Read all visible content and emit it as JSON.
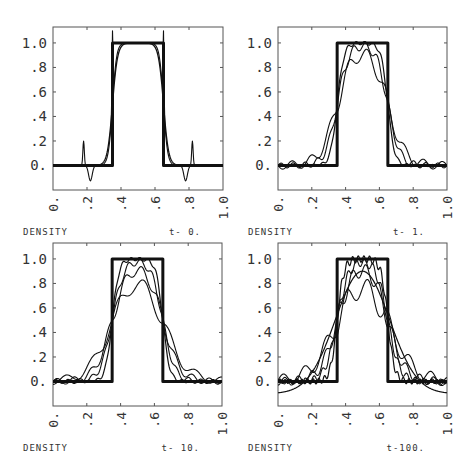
{
  "chart_data": [
    {
      "type": "line",
      "panel": "top-left",
      "time_label": "t- 0.",
      "xlabel": "DENSITY",
      "xlim": [
        0,
        1
      ],
      "ylim": [
        -0.2,
        1.13
      ],
      "x_ticks": [
        "0.",
        ".2",
        ".4",
        ".6",
        ".8",
        "1.0"
      ],
      "y_ticks": [
        "0.",
        ".2",
        ".4",
        ".6",
        ".8",
        "1.0"
      ],
      "series": [
        {
          "name": "exact",
          "kind": "pulse",
          "lo": 0.35,
          "hi": 0.65,
          "width": 3
        },
        {
          "name": "solution-a",
          "kind": "smooth",
          "lo": 0.35,
          "hi": 0.65,
          "edge": 0.015,
          "ripple": 0.0,
          "width": 1.3
        },
        {
          "name": "solution-b",
          "kind": "overshoot",
          "lo": 0.35,
          "hi": 0.65,
          "edge": 0.012,
          "spike": 0.25,
          "width": 1.1
        }
      ]
    },
    {
      "type": "line",
      "panel": "top-right",
      "time_label": "t- 1.",
      "xlabel": "DENSITY",
      "xlim": [
        0,
        1
      ],
      "ylim": [
        -0.2,
        1.13
      ],
      "x_ticks": [
        "0.",
        ".2",
        ".4",
        ".6",
        ".8",
        "1.0"
      ],
      "y_ticks": [
        "0.",
        ".2",
        ".4",
        ".6",
        ".8",
        "1.0"
      ],
      "series": [
        {
          "name": "exact",
          "kind": "pulse",
          "lo": 0.35,
          "hi": 0.65,
          "width": 3
        },
        {
          "name": "solution-a",
          "kind": "smooth",
          "lo": 0.35,
          "hi": 0.65,
          "edge": 0.02,
          "ripple": 0.02,
          "freq": 40,
          "width": 1.2
        },
        {
          "name": "solution-b",
          "kind": "smooth",
          "lo": 0.35,
          "hi": 0.65,
          "edge": 0.035,
          "ripple": 0.05,
          "freq": 28,
          "width": 1.1
        },
        {
          "name": "solution-c",
          "kind": "smooth",
          "lo": 0.35,
          "hi": 0.65,
          "edge": 0.05,
          "ripple": 0.08,
          "freq": 18,
          "width": 1.1
        }
      ]
    },
    {
      "type": "line",
      "panel": "bottom-left",
      "time_label": "t- 10.",
      "xlabel": "DENSITY",
      "xlim": [
        0,
        1
      ],
      "ylim": [
        -0.2,
        1.13
      ],
      "x_ticks": [
        "0.",
        ".2",
        ".4",
        ".6",
        ".8",
        "1.0"
      ],
      "y_ticks": [
        "0.",
        ".2",
        ".4",
        ".6",
        ".8",
        "1.0"
      ],
      "series": [
        {
          "name": "exact",
          "kind": "pulse",
          "lo": 0.35,
          "hi": 0.65,
          "width": 3
        },
        {
          "name": "solution-a",
          "kind": "smooth",
          "lo": 0.35,
          "hi": 0.65,
          "edge": 0.02,
          "ripple": 0.02,
          "freq": 40,
          "width": 1.2
        },
        {
          "name": "solution-b",
          "kind": "smooth",
          "lo": 0.35,
          "hi": 0.65,
          "edge": 0.035,
          "ripple": 0.04,
          "freq": 28,
          "width": 1.1
        },
        {
          "name": "solution-c",
          "kind": "smooth",
          "lo": 0.35,
          "hi": 0.65,
          "edge": 0.05,
          "ripple": 0.06,
          "freq": 20,
          "width": 1.1
        },
        {
          "name": "solution-d",
          "kind": "smooth",
          "lo": 0.35,
          "hi": 0.65,
          "edge": 0.07,
          "ripple": 0.08,
          "freq": 13,
          "width": 1.1
        }
      ]
    },
    {
      "type": "line",
      "panel": "bottom-right",
      "time_label": "t-100.",
      "xlabel": "DENSITY",
      "xlim": [
        0,
        1
      ],
      "ylim": [
        -0.2,
        1.13
      ],
      "x_ticks": [
        "0.",
        ".2",
        ".4",
        ".6",
        ".8",
        "1.0"
      ],
      "y_ticks": [
        "0.",
        ".2",
        ".4",
        ".6",
        ".8",
        "1.0"
      ],
      "series": [
        {
          "name": "exact",
          "kind": "pulse",
          "lo": 0.35,
          "hi": 0.65,
          "width": 3
        },
        {
          "name": "solution-a",
          "kind": "smooth",
          "lo": 0.35,
          "hi": 0.65,
          "edge": 0.02,
          "ripple": 0.04,
          "freq": 60,
          "width": 1.2
        },
        {
          "name": "solution-b",
          "kind": "smooth",
          "lo": 0.35,
          "hi": 0.65,
          "edge": 0.035,
          "ripple": 0.05,
          "freq": 40,
          "width": 1.1
        },
        {
          "name": "solution-c",
          "kind": "smooth",
          "lo": 0.35,
          "hi": 0.65,
          "edge": 0.05,
          "ripple": 0.08,
          "freq": 25,
          "width": 1.1
        },
        {
          "name": "solution-d",
          "kind": "smooth",
          "lo": 0.35,
          "hi": 0.65,
          "edge": 0.075,
          "ripple": 0.12,
          "freq": 16,
          "width": 1.1
        },
        {
          "name": "solution-e",
          "kind": "gauss",
          "center": 0.5,
          "peak": 0.9,
          "sigma": 0.16,
          "base": -0.1,
          "width": 1.2
        }
      ]
    }
  ],
  "panels_layout": [
    {
      "x": 53,
      "y": 27,
      "w": 170,
      "h": 163
    },
    {
      "x": 278,
      "y": 27,
      "w": 169,
      "h": 163
    },
    {
      "x": 53,
      "y": 243,
      "w": 169,
      "h": 163
    },
    {
      "x": 278,
      "y": 243,
      "w": 169,
      "h": 163
    }
  ],
  "colors": {
    "line": "#111111",
    "frame": "#555555",
    "text": "#333333",
    "background": "#ffffff"
  }
}
